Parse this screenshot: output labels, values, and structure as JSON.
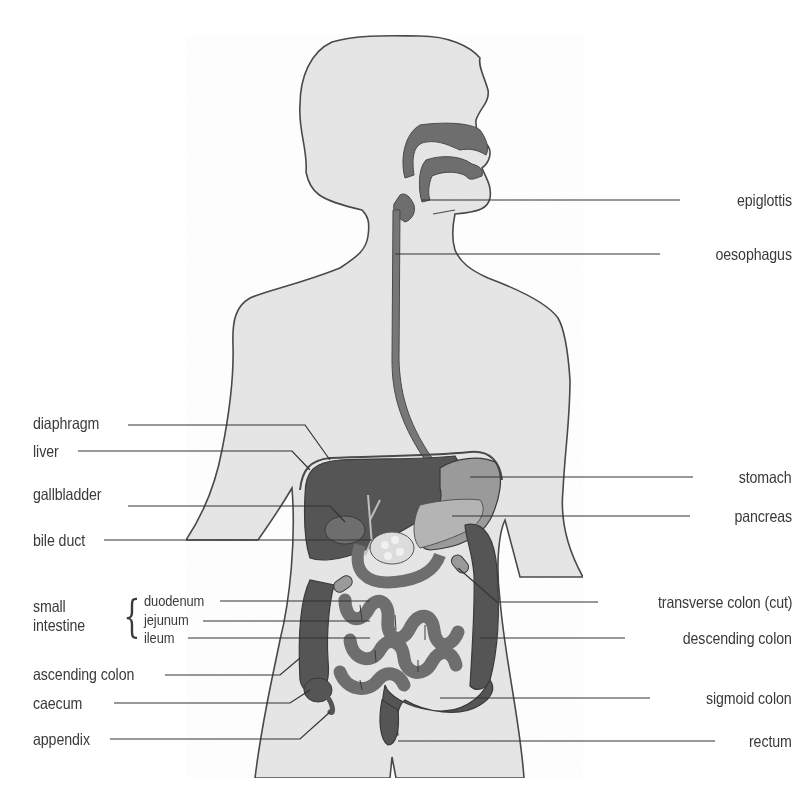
{
  "diagram": {
    "title_visible": false,
    "colors": {
      "background": "#ffffff",
      "body_fill": "#e6e6e6",
      "outline": "#4a4a4a",
      "organ_dark": "#555555",
      "organ_mid": "#6e6e6e",
      "organ_light": "#9a9a9a",
      "pancreas": "#b4b4b4",
      "text": "#3a3a3a",
      "leader_line": "#333333"
    },
    "labels_right": [
      {
        "id": "epiglottis",
        "text": "epiglottis"
      },
      {
        "id": "oesophagus",
        "text": "oesophagus"
      },
      {
        "id": "stomach",
        "text": "stomach"
      },
      {
        "id": "pancreas",
        "text": "pancreas"
      },
      {
        "id": "transverse-colon",
        "text": "transverse colon (cut)"
      },
      {
        "id": "descending-colon",
        "text": "descending colon"
      },
      {
        "id": "sigmoid-colon",
        "text": "sigmoid colon"
      },
      {
        "id": "rectum",
        "text": "rectum"
      }
    ],
    "labels_left": [
      {
        "id": "diaphragm",
        "text": "diaphragm"
      },
      {
        "id": "liver",
        "text": "liver"
      },
      {
        "id": "gallbladder",
        "text": "gallbladder"
      },
      {
        "id": "bile-duct",
        "text": "bile duct"
      },
      {
        "id": "ascending-colon",
        "text": "ascending colon"
      },
      {
        "id": "caecum",
        "text": "caecum"
      },
      {
        "id": "appendix",
        "text": "appendix"
      }
    ],
    "small_intestine": {
      "group_label_line1": "small",
      "group_label_line2": "intestine",
      "parts": [
        {
          "id": "duodenum",
          "text": "duodenum"
        },
        {
          "id": "jejunum",
          "text": "jejunum"
        },
        {
          "id": "ileum",
          "text": "ileum"
        }
      ]
    }
  }
}
